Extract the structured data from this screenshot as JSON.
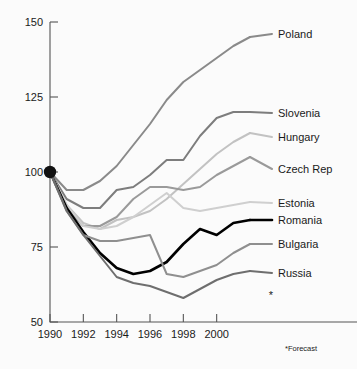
{
  "chart_data": {
    "type": "line",
    "title": "",
    "subtitle": "",
    "xlabel": "",
    "ylabel": "",
    "xlim": [
      1990,
      2002
    ],
    "ylim": [
      50,
      150
    ],
    "grid": false,
    "legend_position": "right-inline-labels",
    "index_base": {
      "year": 1990,
      "value": 100,
      "marker": "filled-circle"
    },
    "x_ticks": [
      "1990",
      "1992",
      "1994",
      "1996",
      "1998",
      "2000"
    ],
    "x_tick_values": [
      1990,
      1992,
      1994,
      1996,
      1998,
      2000
    ],
    "y_ticks": [
      "50",
      "75",
      "100",
      "125",
      "150"
    ],
    "y_tick_values": [
      50,
      75,
      100,
      125,
      150
    ],
    "annotations": [
      {
        "name": "forecast-note",
        "text": "*Forecast"
      },
      {
        "name": "forecast-asterisk",
        "text": "*"
      }
    ],
    "x": [
      1990,
      1991,
      1992,
      1993,
      1994,
      1995,
      1996,
      1997,
      1998,
      1999,
      2000,
      2001,
      2002
    ],
    "series": [
      {
        "name": "Poland",
        "color": "#8a8a8a",
        "width": 2.0,
        "label": "Poland",
        "values": [
          100,
          94,
          94,
          97,
          102,
          109,
          116,
          124,
          130,
          134,
          138,
          142,
          145
        ]
      },
      {
        "name": "Slovenia",
        "color": "#7d7d7d",
        "width": 2.0,
        "label": "Slovenia",
        "values": [
          100,
          91,
          88,
          88,
          94,
          95,
          99,
          104,
          104,
          112,
          118,
          120,
          120
        ]
      },
      {
        "name": "Hungary",
        "color": "#c2c2c2",
        "width": 2.0,
        "label": "Hungary",
        "values": [
          100,
          89,
          83,
          81,
          84,
          85,
          87,
          91,
          96,
          101,
          106,
          110,
          113
        ]
      },
      {
        "name": "Czech Rep",
        "color": "#9a9a9a",
        "width": 2.0,
        "label": "Czech Rep",
        "values": [
          100,
          88,
          82,
          82,
          85,
          91,
          95,
          95,
          94,
          95,
          99,
          102,
          105
        ]
      },
      {
        "name": "Estonia",
        "color": "#cfcfcf",
        "width": 2.0,
        "label": "Estonia",
        "values": [
          100,
          89,
          82,
          81,
          82,
          85,
          89,
          93,
          88,
          87,
          88,
          89,
          90
        ]
      },
      {
        "name": "Romania",
        "color": "#000000",
        "width": 2.6,
        "label": "Romania",
        "values": [
          100,
          88,
          80,
          73,
          68,
          66,
          67,
          70,
          76,
          81,
          79,
          83,
          84
        ]
      },
      {
        "name": "Bulgaria",
        "color": "#8f8f8f",
        "width": 2.0,
        "label": "Bulgaria",
        "values": [
          100,
          87,
          79,
          77,
          77,
          78,
          79,
          66,
          65,
          67,
          69,
          73,
          76
        ]
      },
      {
        "name": "Russia",
        "color": "#6e6e6e",
        "width": 2.0,
        "label": "Russia",
        "values": [
          100,
          87,
          79,
          72,
          65,
          63,
          62,
          60,
          58,
          61,
          64,
          66,
          67
        ]
      }
    ]
  },
  "axes": {
    "y_labels": [
      {
        "text": "150",
        "value": 150
      },
      {
        "text": "125",
        "value": 125
      },
      {
        "text": "100",
        "value": 100
      },
      {
        "text": "75",
        "value": 75
      },
      {
        "text": "50",
        "value": 50
      }
    ],
    "x_labels": [
      {
        "text": "1990",
        "value": 1990
      },
      {
        "text": "1992",
        "value": 1992
      },
      {
        "text": "1994",
        "value": 1994
      },
      {
        "text": "1996",
        "value": 1996
      },
      {
        "text": "1998",
        "value": 1998
      },
      {
        "text": "2000",
        "value": 2000
      }
    ]
  },
  "footnote": {
    "text": "*Forecast",
    "marker": "*"
  },
  "colors": {
    "background": "#fbfbfb",
    "axis": "#555555",
    "text": "#1a1a1a",
    "highlight_series": "#000000"
  }
}
